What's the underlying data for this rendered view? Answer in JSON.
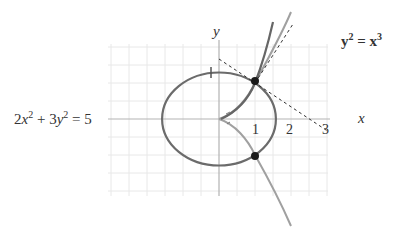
{
  "figure": {
    "ellipse_equation": {
      "text": "2x² + 3y² = 5",
      "parts": [
        "2",
        "x",
        "2",
        " + 3",
        "y",
        "2",
        " = 5"
      ]
    },
    "cusp_equation": {
      "text": "y² = x³",
      "parts": [
        "y",
        "2",
        " = ",
        "x",
        "3"
      ]
    },
    "axis_labels": {
      "x": "x",
      "y": "y"
    },
    "x_ticks": [
      "1",
      "2",
      "3"
    ],
    "y_ticks": [
      "1"
    ],
    "intersection_points": [
      {
        "x": 1,
        "y": 1
      },
      {
        "x": 1,
        "y": -1
      }
    ],
    "colors": {
      "grid": "#e6e6e6",
      "axis": "#b3b3b3",
      "ellipse": "#6b6b6b",
      "cusp_curve": "#9a9a9a",
      "steep_curve": "#666666",
      "tangent_dashed": "#333333",
      "point": "#1a1a1a"
    }
  }
}
